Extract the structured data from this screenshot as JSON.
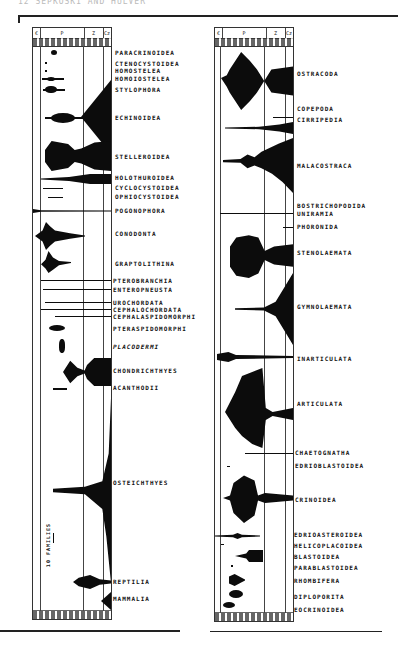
{
  "running_head": "12 SEPKOSKI AND HULVER",
  "panels": [
    {
      "id": "left",
      "header": {
        "era_cells": [
          "€",
          "P",
          "Z",
          "Cz"
        ]
      },
      "scale_label": "10 FAMILIES",
      "taxa": [
        {
          "name": "PARACRINOIDEA",
          "y": 52
        },
        {
          "name": "CTENOCYSTOIDEA",
          "y": 63
        },
        {
          "name": "HOMOSTELEA",
          "y": 70
        },
        {
          "name": "HOMOIOSTELEA",
          "y": 78
        },
        {
          "name": "STYLOPHORA",
          "y": 89
        },
        {
          "name": "ECHINOIDEA",
          "y": 117
        },
        {
          "name": "STELLEROIDEA",
          "y": 156
        },
        {
          "name": "HOLOTHUROIDEA",
          "y": 177
        },
        {
          "name": "CYCLOCYSTOIDEA",
          "y": 187
        },
        {
          "name": "OPHIOCYSTOIDEA",
          "y": 196
        },
        {
          "name": "POGONOPHORA",
          "y": 210
        },
        {
          "name": "CONODONTA",
          "y": 233
        },
        {
          "name": "GRAPTOLITHINA",
          "y": 263
        },
        {
          "name": "PTEROBRANCHIA",
          "y": 280
        },
        {
          "name": "ENTEROPNEUSTA",
          "y": 289
        },
        {
          "name": "UROCHORDATA",
          "y": 302
        },
        {
          "name": "CEPHALOCHORDATA",
          "y": 309
        },
        {
          "name": "CEPHALASPIDOMORPHI",
          "y": 316
        },
        {
          "name": "PTERASPIDOMORPHI",
          "y": 328
        },
        {
          "name": "PLACODERMI",
          "y": 346,
          "italic": true
        },
        {
          "name": "CHONDRICHTHYES",
          "y": 370
        },
        {
          "name": "ACANTHODII",
          "y": 387
        },
        {
          "name": "OSTEICHTHYES",
          "y": 482
        },
        {
          "name": "REPTILIA",
          "y": 581
        },
        {
          "name": "MAMMALIA",
          "y": 598
        }
      ]
    },
    {
      "id": "right",
      "header": {
        "era_cells": [
          "€",
          "P",
          "Z",
          "Cz"
        ]
      },
      "taxa": [
        {
          "name": "OSTRACODA",
          "y": 73
        },
        {
          "name": "COPEPODA",
          "y": 108
        },
        {
          "name": "CIRRIPEDIA",
          "y": 119
        },
        {
          "name": "MALACOSTRACA",
          "y": 165
        },
        {
          "name": "BOSTRICHOPODIDA",
          "y": 205
        },
        {
          "name": "UNIRAMIA",
          "y": 213
        },
        {
          "name": "PHORONIDA",
          "y": 226
        },
        {
          "name": "STENOLAEMATA",
          "y": 252
        },
        {
          "name": "GYMNOLAEMATA",
          "y": 306
        },
        {
          "name": "INARTICULATA",
          "y": 358
        },
        {
          "name": "ARTICULATA",
          "y": 403
        },
        {
          "name": "CHAETOGNATHA",
          "y": 452
        },
        {
          "name": "EDRIOBLASTOIDEA",
          "y": 465
        },
        {
          "name": "CRINOIDEA",
          "y": 499
        },
        {
          "name": "EDRIOASTEROIDEA",
          "y": 534
        },
        {
          "name": "HELICOPLACOIDEA",
          "y": 545
        },
        {
          "name": "BLASTOIDEA",
          "y": 556
        },
        {
          "name": "PARABLASTOIDEA",
          "y": 567
        },
        {
          "name": "RHOMBIFERA",
          "y": 580
        },
        {
          "name": "DIPLOPORITA",
          "y": 596
        },
        {
          "name": "EOCRINOIDEA",
          "y": 609
        }
      ]
    }
  ]
}
